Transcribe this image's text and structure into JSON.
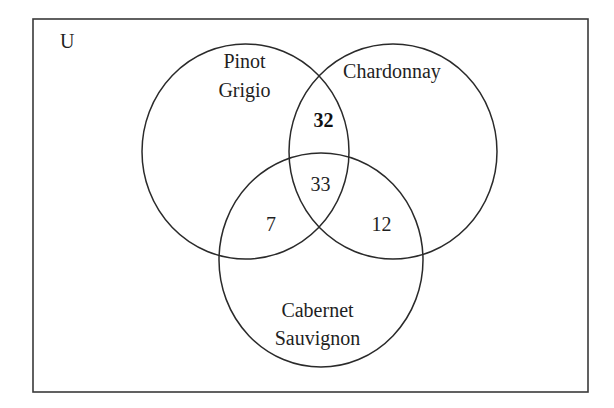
{
  "diagram": {
    "type": "venn",
    "universe_label": "U",
    "sets": [
      {
        "id": "pinot",
        "label_lines": [
          "Pinot",
          "Grigio"
        ]
      },
      {
        "id": "chardonnay",
        "label_lines": [
          "Chardonnay"
        ]
      },
      {
        "id": "cabernet",
        "label_lines": [
          "Cabernet",
          "Sauvignon"
        ]
      }
    ],
    "regions": {
      "pinot_chardonnay_only": {
        "value": "32",
        "bold": true
      },
      "all_three": {
        "value": "33",
        "bold": false
      },
      "pinot_cabernet_only": {
        "value": "7",
        "bold": false
      },
      "chardonnay_cabernet_only": {
        "value": "12",
        "bold": false
      }
    }
  }
}
